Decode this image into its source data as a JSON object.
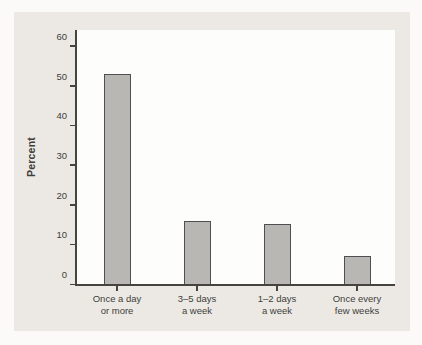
{
  "chart_data": {
    "type": "bar",
    "title": "",
    "categories": [
      "Once a day\nor more",
      "3–5 days\na week",
      "1–2 days\na week",
      "Once every\nfew weeks"
    ],
    "values": [
      53,
      16,
      15,
      7
    ],
    "xlabel": "",
    "ylabel": "Percent",
    "ylim": [
      0,
      60
    ],
    "yticks": [
      0,
      10,
      20,
      30,
      40,
      50,
      60
    ],
    "axis_headroom_ratio": 1.075,
    "grid": false,
    "legend": "none",
    "colors": {
      "page_background": "#fbfaf8",
      "panel_background": "#ece9e4",
      "plot_background": "#fdfdfc",
      "bar_fill": "#b9b7b4",
      "bar_border": "#4f4e50",
      "axis": "#45443f",
      "text": "#403e3a"
    }
  }
}
